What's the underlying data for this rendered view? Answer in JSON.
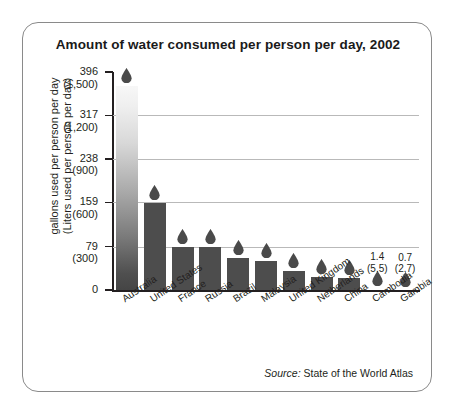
{
  "title": "Amount of water consumed per person per day, 2002",
  "source_prefix": "Source:",
  "source_text": " State of the World Atlas",
  "y_axis_label": "gallons used per person per day\n(Liters used per person per day)",
  "y_ticks": [
    {
      "gallons": "396",
      "liters": "(1,500)",
      "value": 396
    },
    {
      "gallons": "317",
      "liters": "(1,200)",
      "value": 317
    },
    {
      "gallons": "238",
      "liters": "(900)",
      "value": 238
    },
    {
      "gallons": "159",
      "liters": "(600)",
      "value": 159
    },
    {
      "gallons": "79",
      "liters": "(300)",
      "value": 79
    },
    {
      "gallons": "0",
      "liters": "",
      "value": 0
    }
  ],
  "colors": {
    "bar": "#4d4d4d",
    "gridline": "#b9b9b9",
    "axis": "#231f20",
    "border": "#8a8a8a",
    "text": "#231f20"
  },
  "chart_data": {
    "type": "bar",
    "title": "Amount of water consumed per person per day, 2002",
    "xlabel": "",
    "ylabel": "gallons used per person per day (Liters used per person per day)",
    "ylim": [
      0,
      396
    ],
    "grid": true,
    "legend": "none",
    "units": {
      "primary": "gallons per person per day",
      "secondary": "liters per person per day"
    },
    "categories": [
      "Australia",
      "United States",
      "France",
      "Russia",
      "Brazil",
      "Malaysia",
      "United Kingdom",
      "Netherlands",
      "China",
      "Cambodia",
      "Gambia"
    ],
    "values": [
      370,
      158,
      79,
      78,
      58,
      53,
      35,
      23,
      22,
      1.4,
      0.7
    ],
    "values_liters": [
      1400,
      600,
      300,
      295,
      220,
      200,
      132,
      87,
      83,
      5.5,
      2.7
    ],
    "point_labels": [
      {
        "category": "Cambodia",
        "gallons": "1.4",
        "liters": "(5.5)"
      },
      {
        "category": "Gambia",
        "gallons": "0.7",
        "liters": "(2.7)"
      }
    ],
    "annotations": [
      "Each bar is topped by a water-droplet marker."
    ],
    "source": "Source: State of the World Atlas"
  }
}
